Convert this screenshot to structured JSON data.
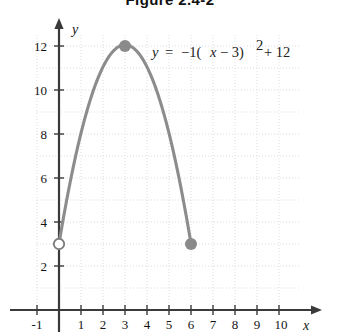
{
  "figure": {
    "title": "Figure 2.4-2"
  },
  "axes": {
    "x_axis_label": "x",
    "y_axis_label": "y",
    "x_tick_labels": [
      "-1",
      "1",
      "2",
      "3",
      "4",
      "5",
      "6",
      "7",
      "8",
      "9",
      "10"
    ],
    "y_tick_labels": [
      "2",
      "4",
      "6",
      "8",
      "10",
      "12"
    ]
  },
  "annotations": {
    "equation_y": "y",
    "equation_eq": "=",
    "equation_neg_one": "−1(",
    "equation_x": "x",
    "equation_minus_three": "− 3)",
    "equation_exponent": "2",
    "equation_plus_twelve": "+ 12",
    "equation_plain": "y = −1(x − 3)² + 12"
  },
  "colors": {
    "curve": "#8c8c8c",
    "axis": "#3a3a3a",
    "grid": "#d9d9d9",
    "point_fill": "#8a8a8a",
    "text": "#141414",
    "background": "#ffffff"
  },
  "chart_data": {
    "type": "line",
    "title": "Figure 2.4-2",
    "xlabel": "x",
    "ylabel": "y",
    "xlim": [
      -1.6,
      11.2
    ],
    "ylim": [
      -0.6,
      13.2
    ],
    "grid": true,
    "legend": null,
    "equation": "y = -1(x - 3)^2 + 12",
    "domain_restriction": "0 < x <= 6",
    "series": [
      {
        "name": "y = -1(x - 3)^2 + 12",
        "x": [
          0,
          0.3,
          0.6,
          0.9,
          1.2,
          1.5,
          1.8,
          2.1,
          2.4,
          2.7,
          3,
          3.3,
          3.6,
          3.9,
          4.2,
          4.5,
          4.8,
          5.1,
          5.4,
          5.7,
          6
        ],
        "y": [
          3,
          4.71,
          6.24,
          7.59,
          8.76,
          9.75,
          10.56,
          11.19,
          11.64,
          11.91,
          12,
          11.91,
          11.64,
          11.19,
          10.56,
          9.75,
          8.76,
          7.59,
          6.24,
          4.71,
          3
        ]
      }
    ],
    "annotated_points": [
      {
        "label": "vertex",
        "x": 3,
        "y": 12,
        "marker": "filled-circle"
      },
      {
        "label": "left-endpoint-open",
        "x": 0,
        "y": 3,
        "marker": "open-circle"
      },
      {
        "label": "right-endpoint-closed",
        "x": 6,
        "y": 3,
        "marker": "filled-circle"
      }
    ],
    "x_ticks": [
      -1,
      1,
      2,
      3,
      4,
      5,
      6,
      7,
      8,
      9,
      10
    ],
    "y_ticks": [
      2,
      4,
      6,
      8,
      10,
      12
    ]
  }
}
